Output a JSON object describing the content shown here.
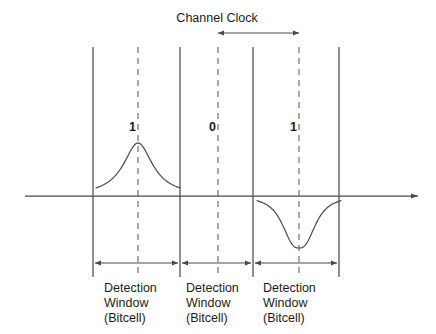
{
  "figure": {
    "title_label": "Channel Clock",
    "axis": {
      "baseline_y": 196,
      "x_start": 25,
      "x_end": 418,
      "has_right_arrow": true
    },
    "colors": {
      "line": "#4a4a4a",
      "dashed": "#7a7a7a",
      "text": "#1b1b1b",
      "background": "#ffffff",
      "curve": "#4a4a4a"
    }
  },
  "clock_marker": {
    "label": "Channel Clock",
    "arrow_from_x": 218,
    "arrow_to_x": 299,
    "arrow_y": 33,
    "label_x": 217,
    "label_y": 11
  },
  "boundaries": [
    {
      "name": "boundary-1",
      "x": 93
    },
    {
      "name": "boundary-2",
      "x": 180
    },
    {
      "name": "boundary-3",
      "x": 253
    },
    {
      "name": "boundary-4",
      "x": 339
    }
  ],
  "centers": [
    {
      "name": "center-1",
      "x": 138
    },
    {
      "name": "center-2",
      "x": 218
    },
    {
      "name": "center-3",
      "x": 299
    }
  ],
  "vertical_extent": {
    "top": 47,
    "bottom": 277
  },
  "bits": [
    {
      "value": "1",
      "x": 129,
      "y": 120,
      "center_x": 138
    },
    {
      "value": "0",
      "x": 209,
      "y": 120,
      "center_x": 218
    },
    {
      "value": "1",
      "x": 290,
      "y": 120,
      "center_x": 299
    }
  ],
  "pulses": [
    {
      "name": "positive-pulse",
      "polarity": "positive",
      "center_x": 138,
      "peak_y": 143,
      "amplitude": 53,
      "half_width": 40
    },
    {
      "name": "negative-pulse",
      "polarity": "negative",
      "center_x": 299,
      "peak_y": 248,
      "amplitude": 52,
      "half_width": 40
    }
  ],
  "detection_windows": [
    {
      "name": "detection-window-1",
      "arrow_from_x": 95,
      "arrow_to_x": 178,
      "arrow_y": 263,
      "label_x": 104,
      "label_y": 281,
      "lines": [
        "Detection",
        "Window",
        "(Bitcell)"
      ]
    },
    {
      "name": "detection-window-2",
      "arrow_from_x": 182,
      "arrow_to_x": 251,
      "arrow_y": 263,
      "label_x": 186,
      "label_y": 281,
      "lines": [
        "Detection",
        "Window",
        "(Bitcell)"
      ]
    },
    {
      "name": "detection-window-3",
      "arrow_from_x": 255,
      "arrow_to_x": 337,
      "arrow_y": 263,
      "label_x": 263,
      "label_y": 281,
      "lines": [
        "Detection",
        "Window",
        "(Bitcell)"
      ]
    }
  ]
}
